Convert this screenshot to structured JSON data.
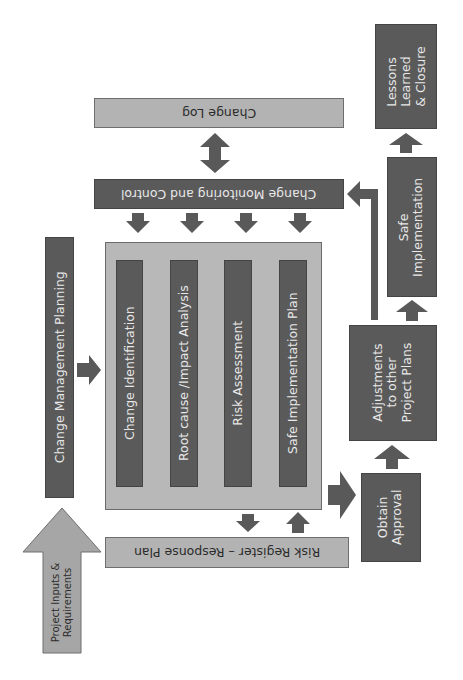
{
  "diagram": {
    "colors": {
      "dark_box": "#5a5a5a",
      "light_box": "#b3b3b3",
      "arrow": "#595959",
      "input_arrow": "#a6a6a6",
      "background": "#ffffff"
    },
    "nodes": {
      "change_log": "Change Log",
      "change_monitoring": "Change Monitoring and Control",
      "change_planning": "Change Management Planning",
      "project_inputs": [
        "Project Inputs &",
        "Requirements"
      ],
      "risk_register": "Risk Register – Response Plan",
      "steps": [
        "Change Identification",
        "Root cause /Impact Analysis",
        "Risk Assessment",
        "Safe Implementation Plan"
      ],
      "obtain_approval": [
        "Obtain",
        "Approval"
      ],
      "adjustments": [
        "Adjustments",
        "to other",
        "Project Plans"
      ],
      "safe_implementation": [
        "Safe",
        "Implementation"
      ],
      "lessons_learned": [
        "Lessons",
        "Learned",
        "& Closure"
      ]
    },
    "edges": [
      {
        "from": "Project Inputs & Requirements",
        "to": "Change Management Planning"
      },
      {
        "from": "Change Management Planning",
        "to": "Change Process Container"
      },
      {
        "from": "Change Identification",
        "to": "Root cause /Impact Analysis"
      },
      {
        "from": "Root cause /Impact Analysis",
        "to": "Risk Assessment"
      },
      {
        "from": "Risk Assessment",
        "to": "Safe Implementation Plan"
      },
      {
        "from": "Change Monitoring and Control",
        "to": "Change Process Container"
      },
      {
        "from": "Change Log",
        "to": "Change Monitoring and Control",
        "bidirectional": true
      },
      {
        "from": "Change Process Container",
        "to": "Risk Register – Response Plan",
        "bidirectional": true
      },
      {
        "from": "Change Process Container",
        "to": "Obtain Approval"
      },
      {
        "from": "Obtain Approval",
        "to": "Adjustments to other Project Plans"
      },
      {
        "from": "Adjustments to other Project Plans",
        "to": "Safe Implementation"
      },
      {
        "from": "Adjustments to other Project Plans",
        "to": "Change Monitoring and Control"
      },
      {
        "from": "Safe Implementation",
        "to": "Lessons Learned & Closure"
      }
    ]
  }
}
